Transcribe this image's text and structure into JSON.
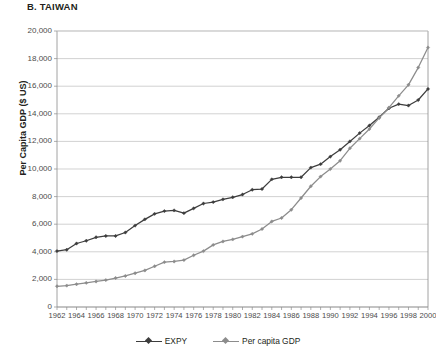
{
  "chart_data": {
    "type": "line",
    "title": "B. TAIWAN",
    "xlabel": "",
    "ylabel": "Per Capita GDP ($ US)",
    "ylim": [
      0,
      20000
    ],
    "ytick_labels": [
      "0",
      "2,000",
      "4,000",
      "6,000",
      "8,000",
      "10,000",
      "12,000",
      "14,000",
      "16,000",
      "18,000",
      "20,000"
    ],
    "ytick_values": [
      0,
      2000,
      4000,
      6000,
      8000,
      10000,
      12000,
      14000,
      16000,
      18000,
      20000
    ],
    "xlim": [
      1962,
      2000
    ],
    "grid": "horizontal",
    "legend_position": "bottom",
    "x": [
      1962,
      1963,
      1964,
      1965,
      1966,
      1967,
      1968,
      1969,
      1970,
      1971,
      1972,
      1973,
      1974,
      1975,
      1976,
      1977,
      1978,
      1979,
      1980,
      1981,
      1982,
      1983,
      1984,
      1985,
      1986,
      1987,
      1988,
      1989,
      1990,
      1991,
      1992,
      1993,
      1994,
      1995,
      1996,
      1997,
      1998,
      1999,
      2000
    ],
    "xtick_labels": [
      "1962",
      "1964",
      "1966",
      "1968",
      "1970",
      "1972",
      "1974",
      "1976",
      "1978",
      "1980",
      "1982",
      "1984",
      "1986",
      "1988",
      "1990",
      "1992",
      "1994",
      "1996",
      "1998",
      "2000"
    ],
    "xtick_values": [
      1962,
      1964,
      1966,
      1968,
      1970,
      1972,
      1974,
      1976,
      1978,
      1980,
      1982,
      1984,
      1986,
      1988,
      1990,
      1992,
      1994,
      1996,
      1998,
      2000
    ],
    "series": [
      {
        "name": "EXPY",
        "color": "#3d3d3d",
        "marker": "diamond",
        "values": [
          4050,
          4150,
          4600,
          4800,
          5050,
          5150,
          5150,
          5400,
          5900,
          6350,
          6750,
          6950,
          7000,
          6800,
          7150,
          7500,
          7600,
          7800,
          7950,
          8150,
          8500,
          8550,
          9250,
          9400,
          9400,
          9400,
          10100,
          10350,
          10900,
          11400,
          12000,
          12600,
          13150,
          13750,
          14400,
          14700,
          14600,
          15000,
          15800
        ]
      },
      {
        "name": "Per capita GDP",
        "color": "#8c8c8c",
        "marker": "diamond",
        "values": [
          1500,
          1550,
          1650,
          1750,
          1850,
          1950,
          2100,
          2250,
          2450,
          2650,
          2950,
          3250,
          3300,
          3400,
          3750,
          4050,
          4500,
          4750,
          4900,
          5100,
          5300,
          5650,
          6200,
          6450,
          7050,
          7900,
          8750,
          9450,
          10000,
          10600,
          11500,
          12200,
          12900,
          13700,
          14450,
          15300,
          16100,
          17350,
          18800
        ]
      }
    ]
  }
}
